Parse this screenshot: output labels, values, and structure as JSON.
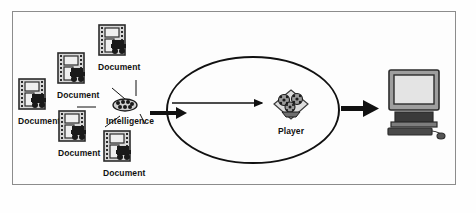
{
  "diagram": {
    "background_color": "#fefefe",
    "frame_border_color": "#8c8c8c",
    "ink_color": "#111111",
    "icon_fill": "#d0d0d0",
    "icon_shadow": "#6b6b6b",
    "documents": [
      {
        "id": "doc-1",
        "label": "Document",
        "x": 18,
        "y": 78,
        "icon": "document-icon"
      },
      {
        "id": "doc-2",
        "label": "Document",
        "x": 57,
        "y": 52,
        "icon": "document-icon"
      },
      {
        "id": "doc-3",
        "label": "Document",
        "x": 98,
        "y": 24,
        "icon": "document-icon"
      },
      {
        "id": "doc-4",
        "label": "Document",
        "x": 58,
        "y": 110,
        "icon": "document-icon"
      },
      {
        "id": "doc-5",
        "label": "Document",
        "x": 103,
        "y": 130,
        "icon": "document-icon"
      }
    ],
    "intelligence": {
      "id": "intelligence",
      "label": "Intelligence",
      "x": 112,
      "y": 98,
      "icon": "intelligence-cluster-icon"
    },
    "player": {
      "id": "player",
      "label": "Player",
      "x": 272,
      "y": 88,
      "icon": "player-group-icon"
    },
    "computer": {
      "id": "computer",
      "label": "",
      "x": 385,
      "y": 68,
      "icon": "desktop-computer-icon"
    },
    "boundary": {
      "id": "system-boundary",
      "shape": "ellipse",
      "cx": 253,
      "cy": 110,
      "rx": 86,
      "ry": 53
    },
    "arrows": [
      {
        "id": "arrow-intelligence-to-boundary",
        "style": "thick",
        "from": "intelligence",
        "to": "system-boundary"
      },
      {
        "id": "arrow-boundary-to-player",
        "style": "thin",
        "from": "boundary-edge",
        "to": "player"
      },
      {
        "id": "arrow-boundary-to-computer",
        "style": "thick",
        "from": "system-boundary",
        "to": "computer"
      }
    ],
    "connectors": [
      {
        "id": "connector-doc-1",
        "from": "doc-1",
        "to": "intelligence"
      },
      {
        "id": "connector-doc-2",
        "from": "doc-2",
        "to": "intelligence"
      },
      {
        "id": "connector-doc-3",
        "from": "doc-3",
        "to": "intelligence"
      },
      {
        "id": "connector-doc-4",
        "from": "doc-4",
        "to": "intelligence"
      },
      {
        "id": "connector-doc-5",
        "from": "doc-5",
        "to": "intelligence"
      }
    ]
  }
}
